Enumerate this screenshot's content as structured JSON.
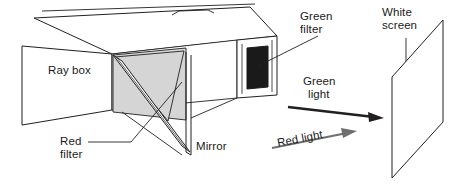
{
  "diagram": {
    "type": "physics-optics-apparatus",
    "labels": {
      "ray_box": "Ray box",
      "green_filter_line1": "Green",
      "green_filter_line2": "filter",
      "white_screen_line1": "White",
      "white_screen_line2": "screen",
      "green_light_line1": "Green",
      "green_light_line2": "light",
      "red_light": "Red light",
      "red_filter_line1": "Red",
      "red_filter_line2": "filter",
      "mirror": "Mirror"
    },
    "colors": {
      "outline": "#231f20",
      "fill_white": "#ffffff",
      "fill_grey": "#d5d5d5",
      "fill_dark": "#1a1a1a",
      "text": "#1a1a1a",
      "text_grey": "#555555",
      "arrow_dark": "#231f20",
      "arrow_grey": "#6e6e6e"
    },
    "parts": [
      {
        "name": "ray-box-body",
        "description": "long rectangular box drawn in oblique projection"
      },
      {
        "name": "ray-box-lid-tab",
        "description": "small tab notch on the top edge of the box"
      },
      {
        "name": "green-filter-panel",
        "description": "dark square filter panel mounted on the right end of the ray box"
      },
      {
        "name": "mirror-panel",
        "description": "thin vertical mirror sheet in front of the box opening"
      },
      {
        "name": "red-filter-panel",
        "description": "grey triangular red filter inside the box opening"
      },
      {
        "name": "white-screen",
        "description": "vertical parallelogram screen at the right of the scene"
      },
      {
        "name": "green-light-arrow",
        "description": "dark arrow pointing right toward the screen"
      },
      {
        "name": "red-light-arrow",
        "description": "grey arrow pointing right toward the screen"
      }
    ]
  }
}
